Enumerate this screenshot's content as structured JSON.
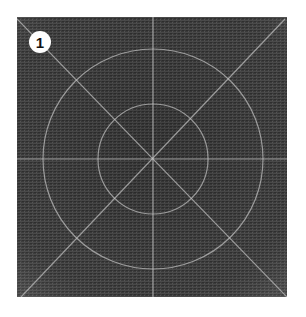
{
  "image": {
    "description": "Photograph of dark gray textured fabric (canvas/linen) with light chalk-like lines drawn on it: two concentric circles, a vertical and horizontal cross line, and two diagonal lines through the center.",
    "badge_number": "1",
    "colors": {
      "fabric": "#3a3a3a",
      "lines": "#c8c8c8",
      "badge_bg": "#ffffff",
      "badge_text": "#111111"
    },
    "drawing": {
      "circles": [
        "outer",
        "inner"
      ],
      "lines": [
        "vertical",
        "horizontal",
        "diagonal-main",
        "diagonal-anti"
      ]
    }
  }
}
